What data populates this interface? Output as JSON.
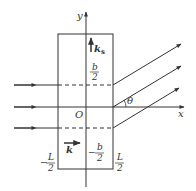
{
  "axes": {
    "x_label": "x",
    "y_label": "y",
    "origin_label": "O"
  },
  "labels": {
    "ks": "k",
    "ks_sub": "s",
    "k": "k",
    "theta": "θ",
    "b_half_num": "b",
    "b_half_den": "2",
    "neg_b_half_sign": "−",
    "neg_b_half_num": "b",
    "neg_b_half_den": "2",
    "neg_L_half_sign": "−",
    "neg_L_half_num": "L",
    "neg_L_half_den": "2",
    "L_half_num": "L",
    "L_half_den": "2"
  },
  "colors": {
    "stroke": "#333333"
  }
}
